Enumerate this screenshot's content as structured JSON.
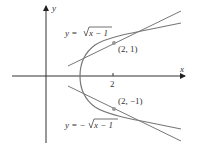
{
  "figure": {
    "axes": {
      "x_label": "x",
      "y_label": "y",
      "x_tick_label": "2"
    },
    "curves": {
      "upper_label_prefix": "y = ",
      "upper_label_radicand": "x − 1",
      "lower_label_prefix": "y = −",
      "lower_label_radicand": "x − 1"
    },
    "points": {
      "upper": "(2, 1)",
      "lower": "(2, −1)"
    },
    "colors": {
      "curve": "#777777",
      "tangent": "#777777",
      "axis": "#333333",
      "point": "#999999"
    }
  }
}
